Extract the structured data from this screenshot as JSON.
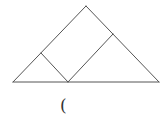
{
  "diagram": {
    "type": "geometry",
    "stroke_color": "#555555",
    "points": {
      "apex": [
        86,
        6
      ],
      "base_left": [
        13,
        82
      ],
      "base_right": [
        159,
        82
      ],
      "left_inner": [
        41,
        53
      ],
      "base_inner": [
        68,
        82
      ],
      "right_inner": [
        113,
        34
      ]
    },
    "segments": [
      {
        "name": "left-side",
        "from": "base_left",
        "to": "apex"
      },
      {
        "name": "right-side",
        "from": "apex",
        "to": "base_right"
      },
      {
        "name": "base",
        "from": "base_left",
        "to": "base_right"
      },
      {
        "name": "inner-left-segment",
        "from": "left_inner",
        "to": "base_inner"
      },
      {
        "name": "inner-right-segment",
        "from": "base_inner",
        "to": "right_inner"
      }
    ]
  },
  "caption": {
    "text": "("
  }
}
